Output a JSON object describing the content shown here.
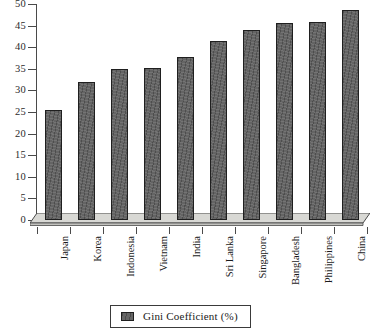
{
  "chart_data": {
    "type": "bar",
    "title": "",
    "subtitle": "",
    "xlabel": "",
    "ylabel": "",
    "categories": [
      "Japan",
      "Korea",
      "Indonesia",
      "Vietnam",
      "India",
      "Sri Lanka",
      "Singapore",
      "Bangladesh",
      "Philippines",
      "China"
    ],
    "values": [
      25.5,
      32.0,
      35.0,
      35.1,
      37.8,
      41.5,
      44.0,
      45.7,
      45.9,
      48.5
    ],
    "series": [
      {
        "name": "Gini Coefficient (%)",
        "values": [
          25.5,
          32.0,
          35.0,
          35.1,
          37.8,
          41.5,
          44.0,
          45.7,
          45.9,
          48.5
        ]
      }
    ],
    "ylim": [
      0,
      50
    ],
    "ytick_values": [
      0,
      5,
      10,
      15,
      20,
      25,
      30,
      35,
      40,
      45,
      50
    ],
    "ytick_labels": [
      "0",
      "5",
      "10",
      "15",
      "20",
      "25",
      "30",
      "35",
      "40",
      "45",
      "50"
    ],
    "grid": false,
    "legend_position": "bottom-center",
    "legend_entries": [
      "Gini Coefficient (%)"
    ],
    "bar_color": "#5c5c5c",
    "bar_edge_color": "#1f1f1f",
    "axis_color": "#4a4a4a",
    "floor_color": "#d8d8d4",
    "background_color": "#ffffff"
  },
  "legend": {
    "label": "Gini Coefficient (%)"
  }
}
